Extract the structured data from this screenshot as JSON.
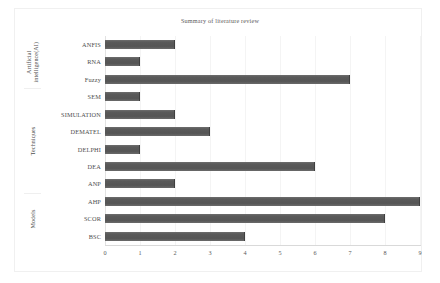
{
  "chart_data": {
    "type": "bar",
    "orientation": "horizontal",
    "title": "Summary of literature review",
    "xlabel": "",
    "ylabel": "",
    "xlim": [
      0,
      9
    ],
    "xticks": [
      0,
      1,
      2,
      3,
      4,
      5,
      6,
      7,
      8,
      9
    ],
    "grid": "vertical",
    "legend": "none",
    "bar_color": "#5c5c5c",
    "categories": [
      "ANFIS",
      "RNA",
      "Fuzzy",
      "SEM",
      "SIMULATION",
      "DEMATEL",
      "DELPHI",
      "DEA",
      "ANP",
      "AHP",
      "SCOR",
      "BSC"
    ],
    "values": [
      2,
      1,
      7,
      1,
      2,
      3,
      1,
      6,
      2,
      9,
      8,
      4
    ],
    "groups": [
      {
        "label": "Artificial intelligence(AI)",
        "categories": [
          "ANFIS",
          "RNA",
          "Fuzzy"
        ]
      },
      {
        "label": "Techniques",
        "categories": [
          "SEM",
          "SIMULATION",
          "DEMATEL",
          "DELPHI",
          "DEA",
          "ANP"
        ]
      },
      {
        "label": "Models",
        "categories": [
          "AHP",
          "SCOR",
          "BSC"
        ]
      }
    ]
  },
  "figure": {
    "title": "Summary of literature review",
    "axis_tick_labels": [
      "0",
      "1",
      "2",
      "3",
      "4",
      "5",
      "6",
      "7",
      "8",
      "9"
    ],
    "group_labels": [
      "Artificial intelligence(AI)",
      "Techniques",
      "Models"
    ]
  }
}
